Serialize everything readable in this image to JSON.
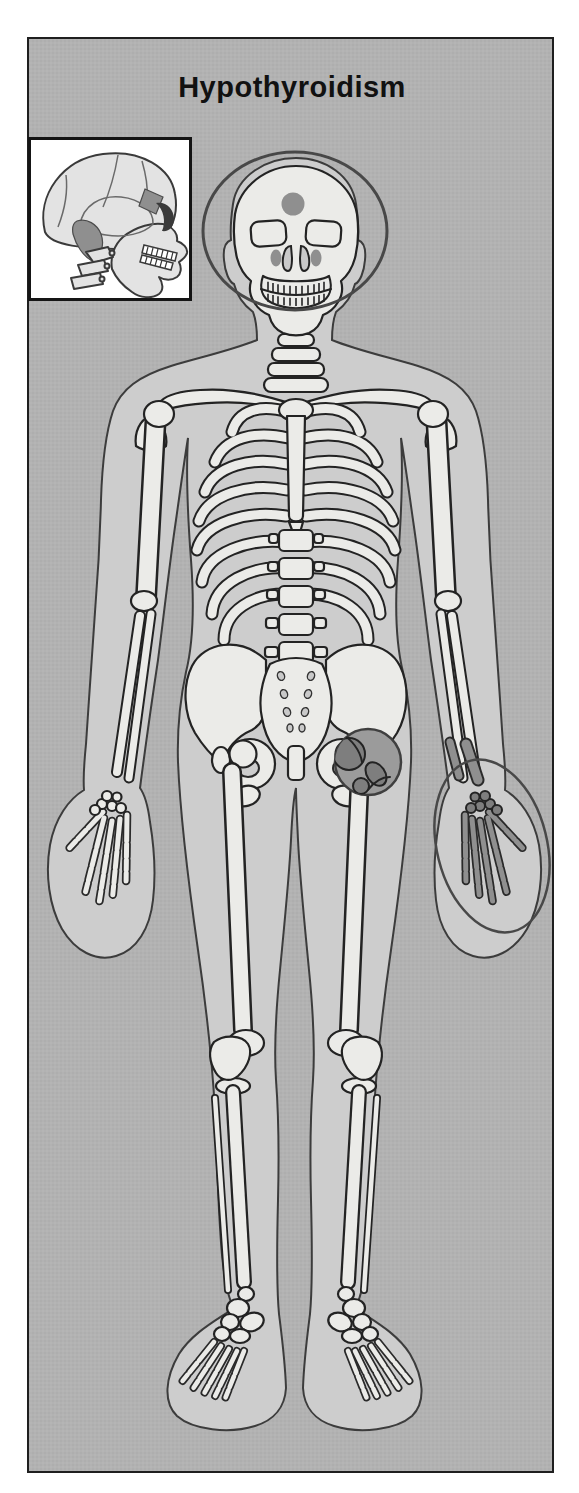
{
  "figure": {
    "title": "Hypothyroidism",
    "kind": "anterior skeleton illustration with shaded affected regions",
    "highlights": {
      "head_ring": "circle outline around skull",
      "forehead_spot": "shaded spot on frontal bone",
      "paranasal_spots": "two shaded spots beside nasal aperture",
      "hip_spot": "shaded circle over hip joint",
      "hand_ring": "ellipse outline around hand",
      "hand_bones": "shaded wrist and finger bones",
      "inset_patches": "shaded temporal and sphenoid regions on lateral skull inset"
    }
  },
  "colors": {
    "page_background": "#ffffff",
    "panel_background": "#b2b2b2",
    "panel_border": "#1f1f1f",
    "title_text": "#111111",
    "body_silhouette": "#cdcdcd",
    "silhouette_outline": "#3c3c3c",
    "bone_fill": "#ebebe8",
    "bone_outline": "#232323",
    "highlight_fill": "#8f8f8f",
    "highlight_dark": "#7e7e7e",
    "hip_circle_fill": "#9b9b9b",
    "ring_stroke": "#484848",
    "inset_background": "#ffffff",
    "inset_border": "#151515"
  }
}
